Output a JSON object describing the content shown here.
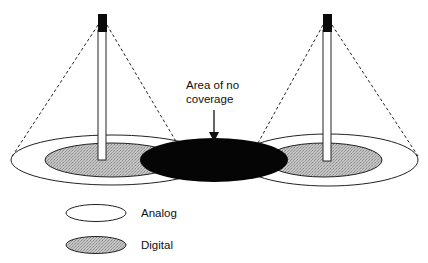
{
  "diagram": {
    "annotation": {
      "line1": "Area of no",
      "line2": "coverage"
    },
    "legend": {
      "items": [
        {
          "label": "Analog",
          "fill": "#ffffff"
        },
        {
          "label": "Digital",
          "fill": "#b8b8b8"
        }
      ]
    },
    "towers": [
      {
        "name": "left-tower"
      },
      {
        "name": "right-tower"
      }
    ],
    "colors": {
      "no_coverage": "#000000",
      "digital": "#b8b8b8",
      "analog": "#ffffff",
      "stroke": "#222222"
    }
  }
}
